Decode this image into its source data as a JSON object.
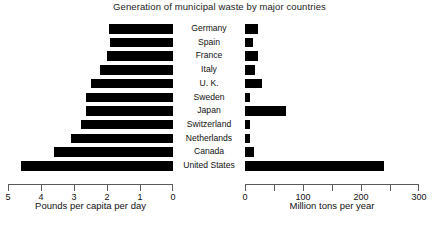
{
  "chart_data": {
    "type": "bar",
    "title": "Generation of municipal waste by major countries",
    "orientation": "horizontal",
    "layout": "back-to-back paired horizontal bars, shared country axis in the middle",
    "grid": false,
    "legend": "none",
    "categories": [
      "Germany",
      "Spain",
      "France",
      "Italy",
      "U. K.",
      "Sweden",
      "Japan",
      "Switzerland",
      "Netherlands",
      "Canada",
      "United States"
    ],
    "series": [
      {
        "name": "Pounds per capita per day",
        "axis": "left",
        "xlabel": "Pounds per capita per day",
        "xlim": [
          5,
          0
        ],
        "axis_direction": "reversed",
        "ticks": [
          5,
          4,
          3,
          2,
          1,
          0
        ],
        "values": [
          1.95,
          1.9,
          2.0,
          2.2,
          2.5,
          2.65,
          2.65,
          2.8,
          3.1,
          3.6,
          4.6
        ]
      },
      {
        "name": "Million tons per year",
        "axis": "right",
        "xlabel": "Million tons per year",
        "xlim": [
          0,
          300
        ],
        "axis_direction": "normal",
        "ticks": [
          0,
          50,
          100,
          150,
          200,
          250,
          300
        ],
        "labeled_ticks": [
          0,
          100,
          200,
          300
        ],
        "values": [
          22,
          14,
          23,
          18,
          30,
          8,
          70,
          8,
          9,
          16,
          239
        ]
      }
    ],
    "colors": {
      "bar": "#000000",
      "axis": "#5a5a5a",
      "text": "#111111",
      "background": "#ffffff"
    }
  },
  "axes": {
    "left": {
      "title": "Pounds per capita per day",
      "tick_labels": [
        "5",
        "4",
        "3",
        "2",
        "1",
        "0"
      ]
    },
    "right": {
      "title": "Million tons per year",
      "tick_labels": [
        "0",
        "100",
        "200",
        "300"
      ]
    }
  }
}
